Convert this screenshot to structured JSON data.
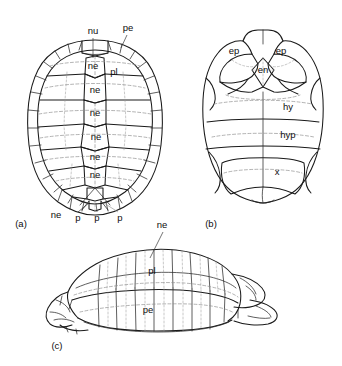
{
  "figure": {
    "background_color": "#ffffff",
    "ink_color": "#1a1a1a",
    "panels": [
      {
        "id": "a",
        "panel_label": "(a)",
        "view": "carapace, dorsal view",
        "labels": [
          {
            "id": "a-nu",
            "text": "nu",
            "x": 93,
            "y": 31
          },
          {
            "id": "a-pe",
            "text": "pe",
            "x": 128,
            "y": 28
          },
          {
            "id": "a-ne1",
            "text": "ne",
            "x": 93,
            "y": 66
          },
          {
            "id": "a-pl",
            "text": "pl",
            "x": 114,
            "y": 72
          },
          {
            "id": "a-ne2",
            "text": "ne",
            "x": 95,
            "y": 90
          },
          {
            "id": "a-ne3",
            "text": "ne",
            "x": 95,
            "y": 113
          },
          {
            "id": "a-ne4",
            "text": "ne",
            "x": 96,
            "y": 137
          },
          {
            "id": "a-ne5",
            "text": "ne",
            "x": 95,
            "y": 157
          },
          {
            "id": "a-ne6",
            "text": "ne",
            "x": 95,
            "y": 175
          },
          {
            "id": "a-ne7",
            "text": "ne",
            "x": 56,
            "y": 215
          },
          {
            "id": "a-p1",
            "text": "p",
            "x": 78,
            "y": 218
          },
          {
            "id": "a-p2",
            "text": "p",
            "x": 97,
            "y": 218
          },
          {
            "id": "a-p3",
            "text": "p",
            "x": 120,
            "y": 218
          }
        ]
      },
      {
        "id": "b",
        "panel_label": "(b)",
        "view": "plastron, ventral view",
        "labels": [
          {
            "id": "b-ep1",
            "text": "ep",
            "x": 234,
            "y": 51
          },
          {
            "id": "b-ep2",
            "text": "ep",
            "x": 281,
            "y": 51
          },
          {
            "id": "b-en",
            "text": "en",
            "x": 263,
            "y": 70
          },
          {
            "id": "b-hy",
            "text": "hy",
            "x": 288,
            "y": 107
          },
          {
            "id": "b-hyp",
            "text": "hyp",
            "x": 288,
            "y": 135
          },
          {
            "id": "b-x",
            "text": "x",
            "x": 277,
            "y": 172
          }
        ]
      },
      {
        "id": "c",
        "panel_label": "(c)",
        "view": "shell, lateral view",
        "labels": [
          {
            "id": "c-ne",
            "text": "ne",
            "x": 162,
            "y": 225
          },
          {
            "id": "c-pl",
            "text": "pl",
            "x": 152,
            "y": 271
          },
          {
            "id": "c-pe",
            "text": "pe",
            "x": 148,
            "y": 310
          }
        ]
      }
    ],
    "panel_markers": [
      {
        "id": "marker-a",
        "text": "(a)",
        "x": 21,
        "y": 224
      },
      {
        "id": "marker-b",
        "text": "(b)",
        "x": 211,
        "y": 224
      },
      {
        "id": "marker-c",
        "text": "(c)",
        "x": 57,
        "y": 346
      }
    ],
    "abbreviations": {
      "nu": "nuchal",
      "ne": "neural",
      "pl": "pleural",
      "pe": "peripheral",
      "p": "pygal / suprapygal",
      "ep": "epiplastron",
      "en": "entoplastron",
      "hy": "hyoplastron",
      "hyp": "hypoplastron",
      "x": "xiphiplastron"
    }
  }
}
